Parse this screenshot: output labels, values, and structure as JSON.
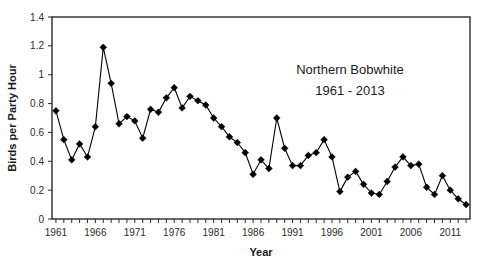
{
  "chart_data": {
    "type": "line",
    "title": "",
    "annotation_lines": [
      "Northern Bobwhite",
      "1961 - 2013"
    ],
    "xlabel": "Year",
    "ylabel": "Birds per Party Hour",
    "xlim": [
      1960.5,
      2013.5
    ],
    "ylim": [
      0,
      1.4
    ],
    "yticks": [
      0,
      0.2,
      0.4,
      0.6,
      0.8,
      1,
      1.2,
      1.4
    ],
    "ytick_labels": [
      "0",
      "0.2",
      "0.4",
      "0.6",
      "0.8",
      "1",
      "1.2",
      "1.4"
    ],
    "xtick_labels": [
      "1961",
      "1966",
      "1971",
      "1976",
      "1981",
      "1986",
      "1991",
      "1996",
      "2001",
      "2006",
      "2011"
    ],
    "xtick_values": [
      1961,
      1966,
      1971,
      1976,
      1981,
      1986,
      1991,
      1996,
      2001,
      2006,
      2011
    ],
    "x_minor_tick_step": 1,
    "grid": false,
    "legend": false,
    "marker": "diamond",
    "marker_color": "#000000",
    "line_color": "#000000",
    "x": [
      1961,
      1962,
      1963,
      1964,
      1965,
      1966,
      1967,
      1968,
      1969,
      1970,
      1971,
      1972,
      1973,
      1974,
      1975,
      1976,
      1977,
      1978,
      1979,
      1980,
      1981,
      1982,
      1983,
      1984,
      1985,
      1986,
      1987,
      1988,
      1989,
      1990,
      1991,
      1992,
      1993,
      1994,
      1995,
      1996,
      1997,
      1998,
      1999,
      2000,
      2001,
      2002,
      2003,
      2004,
      2005,
      2006,
      2007,
      2008,
      2009,
      2010,
      2011,
      2012,
      2013
    ],
    "values": [
      0.75,
      0.55,
      0.41,
      0.52,
      0.43,
      0.64,
      1.19,
      0.94,
      0.66,
      0.71,
      0.68,
      0.56,
      0.76,
      0.74,
      0.84,
      0.91,
      0.77,
      0.85,
      0.82,
      0.79,
      0.7,
      0.64,
      0.57,
      0.53,
      0.46,
      0.31,
      0.41,
      0.35,
      0.7,
      0.49,
      0.37,
      0.37,
      0.44,
      0.46,
      0.55,
      0.43,
      0.19,
      0.29,
      0.33,
      0.24,
      0.18,
      0.17,
      0.26,
      0.36,
      0.43,
      0.37,
      0.38,
      0.22,
      0.17,
      0.3,
      0.2,
      0.14,
      0.1
    ]
  }
}
